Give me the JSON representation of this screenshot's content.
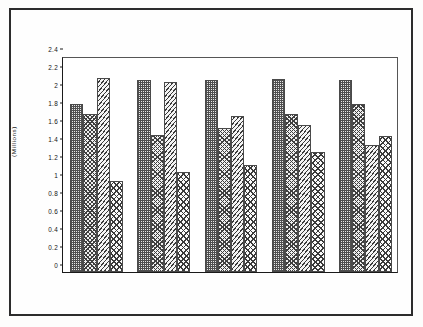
{
  "figure": {
    "ylabel": "(Millions)",
    "border_color": "#2c2c2c",
    "plot_frame_color": "#1a1a1a"
  },
  "chart_data": {
    "type": "bar",
    "title": "",
    "xlabel": "",
    "ylabel": "(Millions)",
    "ylim": [
      0,
      2.4
    ],
    "ytick_values": [
      0,
      0.2,
      0.4,
      0.6,
      0.8,
      1,
      1.2,
      1.4,
      1.6,
      1.8,
      2,
      2.2,
      2.4
    ],
    "ytick_labels": [
      "0",
      "0.2",
      "0.4",
      "0.6",
      "0.8",
      "1",
      "1.2",
      "1.4",
      "1.6",
      "1.8",
      "2",
      "2.2",
      "2.4"
    ],
    "grid": false,
    "legend": null,
    "legend_position": "none",
    "categories": [
      "",
      "",
      "",
      "",
      ""
    ],
    "xtick_labels": [],
    "series": [
      {
        "name": "Series 1",
        "pattern": "checkerboard",
        "values": [
          1.87,
          2.13,
          2.13,
          2.14,
          2.13
        ]
      },
      {
        "name": "Series 2",
        "pattern": "herringbone",
        "values": [
          1.76,
          1.52,
          1.6,
          1.76,
          1.87
        ]
      },
      {
        "name": "Series 3",
        "pattern": "diagonal-hatch",
        "values": [
          2.16,
          2.11,
          1.73,
          1.63,
          1.41
        ]
      },
      {
        "name": "Series 4",
        "pattern": "diamond-crosshatch",
        "values": [
          1.01,
          1.11,
          1.19,
          1.33,
          1.51
        ]
      }
    ]
  }
}
